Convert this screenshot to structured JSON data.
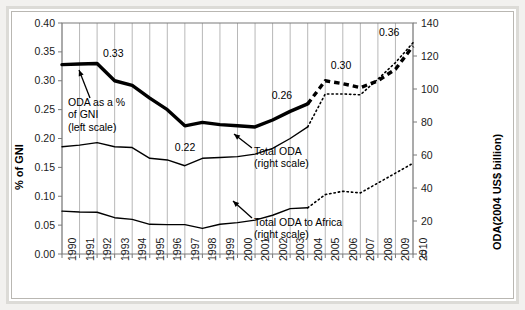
{
  "chart_data": {
    "type": "line",
    "title": "",
    "subtitle": "",
    "xlabel": "",
    "ylabel": "% of GNI",
    "y2label": "ODA(2004 US$ billion)",
    "grid": true,
    "legend_position": "inline-annotations",
    "x": [
      1990,
      1991,
      1992,
      1993,
      1994,
      1995,
      1996,
      1997,
      1998,
      1999,
      2000,
      2001,
      2002,
      2003,
      2004,
      2005,
      2006,
      2007,
      2008,
      2009,
      2010
    ],
    "xticklabels": [
      "1990",
      "1991",
      "1992",
      "1993",
      "1994",
      "1995",
      "1996",
      "1997",
      "1998",
      "1999",
      "2000",
      "2001",
      "2002",
      "2003",
      "2004",
      "2005",
      "2006",
      "2007",
      "2008",
      "2009",
      "2010"
    ],
    "ylim": [
      0.0,
      0.4
    ],
    "yticks": [
      0.0,
      0.05,
      0.1,
      0.15,
      0.2,
      0.25,
      0.3,
      0.35,
      0.4
    ],
    "yticklabels": [
      "0.00",
      "0.05",
      "0.10",
      "0.15",
      "0.20",
      "0.25",
      "0.30",
      "0.35",
      "0.40"
    ],
    "y2lim": [
      0,
      140
    ],
    "y2ticks": [
      0,
      20,
      40,
      60,
      80,
      100,
      120,
      140
    ],
    "y2ticklabels": [
      "0",
      "20",
      "40",
      "60",
      "80",
      "100",
      "120",
      "140"
    ],
    "series": [
      {
        "name": "ODA as a % of GNI (left scale)",
        "axis": "left",
        "style": "thick-solid-then-dashed",
        "solid_through": 2004,
        "values": [
          0.328,
          0.329,
          0.33,
          0.3,
          0.292,
          0.27,
          0.25,
          0.222,
          0.228,
          0.224,
          0.222,
          0.22,
          0.232,
          0.247,
          0.26,
          0.3,
          0.295,
          0.288,
          0.3,
          0.32,
          0.36
        ]
      },
      {
        "name": "Total ODA (right scale)",
        "axis": "right",
        "style": "thin-solid-then-dotted",
        "solid_through": 2004,
        "values": [
          65.0,
          66.0,
          67.5,
          65.0,
          64.5,
          58.0,
          57.0,
          53.5,
          58.0,
          58.5,
          59.0,
          60.5,
          64.0,
          70.0,
          77.0,
          97.0,
          97.0,
          96.5,
          106.0,
          116.0,
          128.0
        ]
      },
      {
        "name": "Total ODA to Africa (right scale)",
        "axis": "right",
        "style": "thin-solid-then-dotted",
        "solid_through": 2004,
        "values": [
          26.0,
          25.5,
          25.3,
          22.0,
          21.0,
          18.0,
          17.8,
          17.8,
          15.5,
          18.0,
          19.0,
          20.5,
          23.5,
          27.5,
          28.0,
          36.0,
          38.0,
          37.0,
          43.0,
          49.0,
          55.0
        ]
      }
    ],
    "data_labels": [
      {
        "text": "0.33",
        "x": 1992,
        "y": 0.33
      },
      {
        "text": "0.22",
        "x": 1997,
        "y": 0.222
      },
      {
        "text": "0.26",
        "x": 2004,
        "y": 0.26
      },
      {
        "text": "0.30",
        "x": 2006,
        "y": 0.3
      },
      {
        "text": "0.36",
        "x": 2010,
        "y": 0.36
      }
    ],
    "annotations": [
      {
        "name": "oda-percent-gni",
        "lines": [
          "ODA as a %",
          "of GNI",
          "(left scale)"
        ],
        "points_to": {
          "x": 1991,
          "y": 0.329
        }
      },
      {
        "name": "total-oda",
        "lines": [
          "Total ODA",
          "(right scale)"
        ],
        "points_to": {
          "x": 2003,
          "y": 70.0
        }
      },
      {
        "name": "total-oda-africa",
        "lines": [
          "Total ODA to Africa",
          "(right scale)"
        ],
        "points_to": {
          "x": 2004,
          "y": 28.0
        }
      }
    ],
    "colors": {
      "line": "#000000",
      "grid": "#9a9a9a",
      "axis": "#7a7a7a",
      "background": "#ffffff",
      "frame": "#dcdbd7"
    }
  }
}
